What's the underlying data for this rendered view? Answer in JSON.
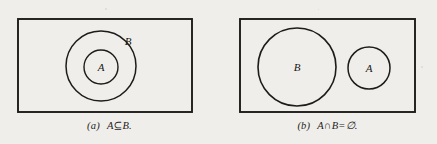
{
  "figure": {
    "kind": "venn-diagram-figure",
    "background_color": "#f0eeea",
    "ink_color": "#1d1c1a",
    "panels": [
      {
        "id": "a",
        "caption_label": "(a)",
        "caption_expression_a": "A",
        "caption_expression_op": "⊆",
        "caption_expression_b": "B.",
        "caption_full": "(a)  A ⊆ B.",
        "relation": "subset",
        "universe_rect": {
          "x": 18,
          "y": 19,
          "width": 174,
          "height": 93
        },
        "circles": [
          {
            "label": "B",
            "cx": 101,
            "cy": 66,
            "r": 35,
            "label_x": 128,
            "label_y": 41
          },
          {
            "label": "A",
            "cx": 101,
            "cy": 67,
            "r": 17,
            "label_x": 101,
            "label_y": 67
          }
        ]
      },
      {
        "id": "b",
        "caption_label": "(b)",
        "caption_expression_a": "A",
        "caption_expression_op": "∩",
        "caption_expression_b": "B",
        "caption_expression_eq": "=",
        "caption_expression_c": "∅.",
        "caption_full": "(b)  A ∩ B = ∅.",
        "relation": "disjoint",
        "universe_rect": {
          "x": 22,
          "y": 19,
          "width": 175,
          "height": 93
        },
        "circles": [
          {
            "label": "B",
            "cx": 79,
            "cy": 67,
            "r": 39,
            "label_x": 79,
            "label_y": 67
          },
          {
            "label": "A",
            "cx": 151,
            "cy": 68,
            "r": 21,
            "label_x": 151,
            "label_y": 68
          }
        ]
      }
    ]
  }
}
